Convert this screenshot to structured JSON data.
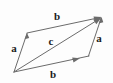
{
  "figure": {
    "type": "vector-parallelogram-diagram",
    "width": 113,
    "height": 83,
    "background_color": "#fdfdfd",
    "stroke_color": "#6b6b6b",
    "label_color": "#1b1b1b"
  },
  "labels": {
    "top_b": "b",
    "left_a": "a",
    "right_a": "a",
    "diagonal_c": "c",
    "bottom_b": "b"
  },
  "geometry": {
    "vertices": {
      "bottom_left": [
        14,
        72
      ],
      "top_left": [
        27,
        33
      ],
      "top_right": [
        101,
        17
      ],
      "bottom_right": [
        88,
        56
      ]
    },
    "edges": [
      {
        "name": "left-a",
        "from": "bottom_left",
        "to": "top_left",
        "label": "a",
        "arrow": "head-at-end"
      },
      {
        "name": "top-b",
        "from": "top_left",
        "to": "top_right",
        "label": "b",
        "arrow": "head-at-end"
      },
      {
        "name": "bottom-b",
        "from": "bottom_left",
        "to": "bottom_right",
        "label": "b",
        "arrow": "head-at-end"
      },
      {
        "name": "right-a",
        "from": "bottom_right",
        "to": "top_right",
        "label": "a",
        "arrow": "head-at-end"
      },
      {
        "name": "diagonal-c",
        "from": "bottom_left",
        "to": "top_right",
        "label": "c",
        "arrow": "head-at-end"
      }
    ],
    "label_positions": {
      "top_b": [
        57,
        16
      ],
      "left_a": [
        14,
        48
      ],
      "right_a": [
        99,
        38
      ],
      "diagonal_c": [
        51,
        41
      ],
      "bottom_b": [
        53,
        74
      ]
    }
  }
}
